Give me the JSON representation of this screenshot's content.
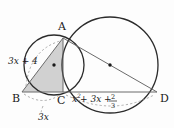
{
  "figure": {
    "background_color": "#fdfdfd",
    "stroke_color": "#2b2b2b",
    "shade_color": "#cfcfcf",
    "chord_color": "#6b6b6b",
    "dash_color": "#9a9a9a",
    "vertices": [
      {
        "id": "A",
        "label": "A",
        "x": 63,
        "y": 38,
        "label_x": 58,
        "label_y": 30
      },
      {
        "id": "B",
        "label": "B",
        "x": 22,
        "y": 92,
        "label_x": 13,
        "label_y": 101
      },
      {
        "id": "C",
        "label": "C",
        "x": 63,
        "y": 92,
        "label_x": 58,
        "label_y": 103
      },
      {
        "id": "D",
        "label": "D",
        "x": 157,
        "y": 92,
        "label_x": 160,
        "label_y": 101
      }
    ],
    "circles": [
      {
        "name": "small-circle",
        "cx": 54,
        "cy": 65,
        "r": 30,
        "center_dot": true,
        "center_dot_x": 54,
        "center_dot_y": 65
      },
      {
        "name": "large-circle",
        "cx": 110,
        "cy": 65,
        "r": 48,
        "center_dot": true,
        "center_dot_x": 110,
        "center_dot_y": 65
      }
    ],
    "labels": {
      "arc_ab": "3x + 4",
      "arc_ab_x": 10,
      "arc_ab_y": 63,
      "arc_bc": "3x",
      "arc_bc_x": 45,
      "arc_bc_y": 116,
      "arc_cd_prefix": "x",
      "arc_cd_exponent": "2",
      "arc_cd_middle": " + 3x + ",
      "arc_cd_frac_numerator": "2",
      "arc_cd_frac_denominator": "3",
      "arc_cd_x": 78,
      "arc_cd_y": 101
    },
    "segments": [
      {
        "name": "segment-BD",
        "x1": 22,
        "y1": 92,
        "x2": 157,
        "y2": 92
      },
      {
        "name": "segment-AC",
        "x1": 63,
        "y1": 38,
        "x2": 63,
        "y2": 92
      },
      {
        "name": "segment-AB",
        "x1": 63,
        "y1": 38,
        "x2": 22,
        "y2": 92
      },
      {
        "name": "segment-AD",
        "x1": 63,
        "y1": 38,
        "x2": 157,
        "y2": 92
      }
    ],
    "shaded_triangle": "63,38 22,92 63,92"
  }
}
